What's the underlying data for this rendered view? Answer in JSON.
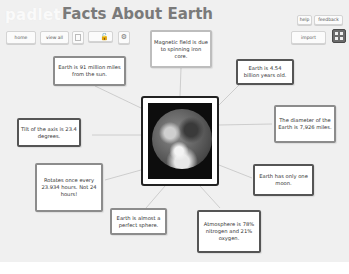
{
  "header": {
    "logo": "padlet",
    "title": "Facts About Earth"
  },
  "toolbar_left": {
    "home_label": "home",
    "view_all_label": "view all",
    "blank_icon": "square-icon",
    "lock_icon": "unlock-icon",
    "settings_icon": "gear-icon"
  },
  "toolbar_right": {
    "help_label": "help",
    "feedback_label": "feedback",
    "import_label": "import",
    "layout_icon": "grid-icon"
  },
  "center_image": {
    "alt": "Earth"
  },
  "notes": [
    {
      "id": "magnetic",
      "text": "Magnetic field is due to spinning iron core."
    },
    {
      "id": "distance",
      "text": "Earth is 91 million miles from the sun."
    },
    {
      "id": "age",
      "text": "Earth is 4.54 billion years old."
    },
    {
      "id": "diameter",
      "text": "The diameter of the Earth is 7,926 miles."
    },
    {
      "id": "tilt",
      "text": "Tilt of the axis is 23.4 degrees."
    },
    {
      "id": "rotation",
      "text": "Rotates once every 23.934 hours. Not 24 hours!"
    },
    {
      "id": "moon",
      "text": "Earth has only one moon."
    },
    {
      "id": "sphere",
      "text": "Earth is almost a perfect sphere."
    },
    {
      "id": "atmosphere",
      "text": "Atmosphere is 78% nitrogen and 21% oxygen."
    }
  ],
  "colors": {
    "board_bg": "#f0f0f0",
    "note_border": "#8c8c8c",
    "title": "#7a7a7a"
  }
}
